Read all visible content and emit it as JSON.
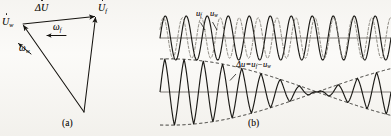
{
  "figure": {
    "panel_a": {
      "caption": "(a)",
      "labels": {
        "delta_u": "ΔU",
        "u_f": "U",
        "u_f_sub": "f",
        "u_w": "U",
        "u_w_sub": "w",
        "omega_f": "ω",
        "omega_f_sub": "f",
        "omega_w": "ω",
        "omega_w_sub": "w"
      },
      "geometry": {
        "apex_left": [
          22,
          24
        ],
        "apex_right": [
          96,
          16
        ],
        "apex_bottom": [
          84,
          112
        ]
      }
    },
    "panel_b": {
      "caption": "(b)",
      "top_plot": {
        "label_uf": "u",
        "label_uf_sub": "f",
        "label_uw": "u",
        "label_uw_sub": "w"
      },
      "bottom_plot": {
        "label_delta": "Δu=u",
        "label_delta_sub1": "f",
        "label_delta_mid": "−u",
        "label_delta_sub2": "w"
      }
    }
  },
  "chart_data": [
    {
      "type": "line",
      "id": "phasor-triangle",
      "title": "(a)",
      "description": "Phasor triangle of forward and reverse voltage vectors",
      "vectors": [
        {
          "name": "U_f",
          "from": [
            84,
            112
          ],
          "to": [
            96,
            16
          ],
          "style": "solid-arrow"
        },
        {
          "name": "U_w",
          "from": [
            84,
            112
          ],
          "to": [
            22,
            24
          ],
          "style": "solid-arrow"
        },
        {
          "name": "delta_U",
          "from": [
            22,
            24
          ],
          "to": [
            96,
            16
          ],
          "style": "solid-arrow"
        }
      ],
      "rotation_arrows": [
        {
          "name": "omega_f",
          "at": [
            60,
            32
          ],
          "direction": "left"
        },
        {
          "name": "omega_w",
          "at": [
            24,
            50
          ],
          "direction": "up-left"
        }
      ],
      "grid": false,
      "legend": "none"
    },
    {
      "type": "line",
      "id": "two-sine-overlay",
      "title": "",
      "xlabel": "",
      "ylabel": "",
      "xlim": [
        0,
        231
      ],
      "ylim": [
        -1.15,
        1.15
      ],
      "grid": false,
      "legend": "inline-annotations",
      "annotations": [
        "u_f",
        "u_w"
      ],
      "series": [
        {
          "name": "u_f",
          "style": "solid",
          "amplitude": 1.0,
          "cycles": 11.0,
          "phase_deg": 0,
          "color": "#1b1a16"
        },
        {
          "name": "u_w",
          "style": "dashed",
          "amplitude": 0.92,
          "cycles": 12.2,
          "phase_deg": 25,
          "color": "#8d8a82"
        }
      ]
    },
    {
      "type": "line",
      "id": "beat-waveform",
      "title": "",
      "xlabel": "",
      "ylabel": "",
      "xlim": [
        0,
        231
      ],
      "ylim": [
        -1.2,
        1.2
      ],
      "grid": false,
      "legend": "inline-annotation",
      "annotations": [
        "Δu=u_f−u_w"
      ],
      "series": [
        {
          "name": "delta_u",
          "style": "solid",
          "carrier_cycles": 12.0,
          "envelope_cycles": 0.5,
          "envelope_node_x": 0.68,
          "color": "#1b1a16"
        },
        {
          "name": "envelope_upper",
          "style": "dashed",
          "color": "#1b1a16"
        },
        {
          "name": "envelope_lower",
          "style": "dashed",
          "color": "#1b1a16"
        }
      ]
    }
  ],
  "colors": {
    "ink": "#15130f",
    "ink_soft": "#8d8a82",
    "axis": "#6f6c66",
    "paper": "#f6f4f0"
  }
}
